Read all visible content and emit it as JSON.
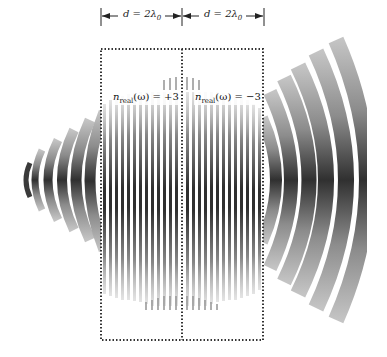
{
  "figure": {
    "dimensions": [
      {
        "label": "d = 2λ₀",
        "var": "d",
        "eq": " = 2λ",
        "sub": "0"
      },
      {
        "label": "d = 2λ₀",
        "var": "d",
        "eq": " = 2λ",
        "sub": "0"
      }
    ],
    "regions": [
      {
        "label": "n_real(ω) = +3",
        "n": "n",
        "sub": "real",
        "arg": "(ω)",
        "value": " = +3"
      },
      {
        "label": "n_real(ω) = −3",
        "n": "n",
        "sub": "real",
        "arg": "(ω)",
        "value": " = −3"
      }
    ],
    "colors": {
      "dark_fringe": "#3a3a3a",
      "mid_fringe": "#8a8a8a",
      "light_fringe": "#b8b8b8",
      "box_border": "#333333"
    }
  }
}
